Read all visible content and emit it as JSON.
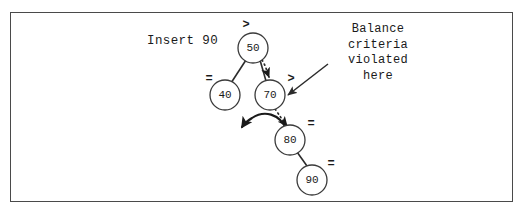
{
  "figure": {
    "caption_text": "Insert 90",
    "annotation_lines": "Balance\ncriteria\nviolated\nhere"
  },
  "tree": {
    "nodes": [
      {
        "key": "50",
        "balance": ">",
        "cx": 253,
        "cy": 48,
        "r": 15,
        "bf_x": 246,
        "bf_y": 25
      },
      {
        "key": "40",
        "balance": "=",
        "cx": 225,
        "cy": 95,
        "r": 15,
        "bf_x": 209,
        "bf_y": 79
      },
      {
        "key": "70",
        "balance": ">",
        "cx": 270,
        "cy": 95,
        "r": 15,
        "bf_x": 293,
        "bf_y": 79
      },
      {
        "key": "80",
        "balance": "=",
        "cx": 290,
        "cy": 140,
        "r": 15,
        "bf_x": 311,
        "bf_y": 124
      },
      {
        "key": "90",
        "balance": "=",
        "cx": 312,
        "cy": 180,
        "r": 15,
        "bf_x": 331,
        "bf_y": 164
      }
    ],
    "edges": [
      {
        "from": "50",
        "to": "40"
      },
      {
        "from": "50",
        "to": "70"
      },
      {
        "from": "80",
        "to": "90"
      }
    ],
    "search_path": [
      {
        "from": "50",
        "to": "70"
      },
      {
        "from": "70",
        "to": "80"
      }
    ]
  },
  "colors": {
    "frame_border": "#4a4a4a",
    "ink": "#1a1a1a",
    "node_stroke": "#3a3a3a",
    "background": "#ffffff"
  }
}
